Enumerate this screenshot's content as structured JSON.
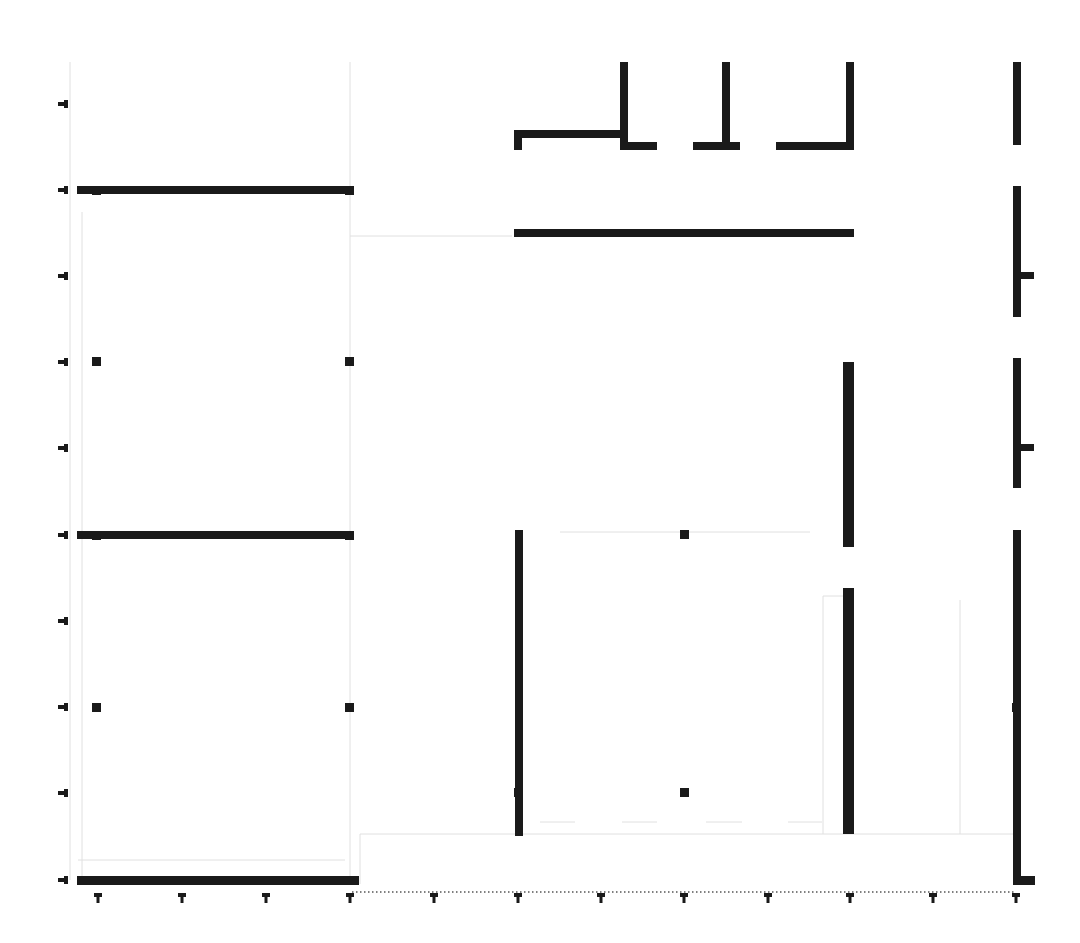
{
  "drawing": {
    "type": "architectural-floor-plan",
    "background": "#ffffff",
    "wall_color": "#1a1a1a",
    "faint_line_color": "#e0e0e0",
    "walls": [
      {
        "id": "w-top-left-h",
        "x": 77,
        "y": 186,
        "w": 277,
        "h": 8
      },
      {
        "id": "w-mid-left-h",
        "x": 77,
        "y": 531,
        "w": 277,
        "h": 8
      },
      {
        "id": "w-bottom-left-h",
        "x": 77,
        "y": 876,
        "w": 282,
        "h": 9
      },
      {
        "id": "w-top-hook-h",
        "x": 514,
        "y": 130,
        "w": 110,
        "h": 8
      },
      {
        "id": "w-top-hook-v",
        "x": 514,
        "y": 130,
        "w": 8,
        "h": 20
      },
      {
        "id": "w-top-col1-v",
        "x": 620,
        "y": 62,
        "w": 8,
        "h": 88
      },
      {
        "id": "w-top-col1-foot",
        "x": 620,
        "y": 142,
        "w": 37,
        "h": 8
      },
      {
        "id": "w-top-col2-v",
        "x": 722,
        "y": 62,
        "w": 8,
        "h": 88
      },
      {
        "id": "w-top-col2-foot",
        "x": 693,
        "y": 142,
        "w": 47,
        "h": 8
      },
      {
        "id": "w-top-col3-v",
        "x": 846,
        "y": 62,
        "w": 8,
        "h": 88
      },
      {
        "id": "w-top-col3-foot",
        "x": 776,
        "y": 142,
        "w": 78,
        "h": 8
      },
      {
        "id": "w-upper-mid-h",
        "x": 514,
        "y": 229,
        "w": 340,
        "h": 8
      },
      {
        "id": "w-center-left-v",
        "x": 515,
        "y": 530,
        "w": 8,
        "h": 306
      },
      {
        "id": "w-center-right-v-upper",
        "x": 843,
        "y": 362,
        "w": 11,
        "h": 185
      },
      {
        "id": "w-center-right-v-lower",
        "x": 843,
        "y": 588,
        "w": 11,
        "h": 246
      },
      {
        "id": "w-right-v-1",
        "x": 1013,
        "y": 62,
        "w": 8,
        "h": 83
      },
      {
        "id": "w-right-v-2",
        "x": 1013,
        "y": 186,
        "w": 8,
        "h": 131
      },
      {
        "id": "w-right-v-2-stub",
        "x": 1021,
        "y": 272,
        "w": 13,
        "h": 7
      },
      {
        "id": "w-right-v-3",
        "x": 1013,
        "y": 358,
        "w": 8,
        "h": 130
      },
      {
        "id": "w-right-v-3-stub",
        "x": 1021,
        "y": 444,
        "w": 13,
        "h": 7
      },
      {
        "id": "w-right-v-4",
        "x": 1013,
        "y": 530,
        "w": 8,
        "h": 354
      },
      {
        "id": "w-right-bottom-foot",
        "x": 1013,
        "y": 876,
        "w": 22,
        "h": 9
      }
    ],
    "columns": [
      {
        "id": "col-a1",
        "x": 92,
        "y": 186,
        "s": 9
      },
      {
        "id": "col-a2",
        "x": 345,
        "y": 186,
        "s": 9
      },
      {
        "id": "col-b1",
        "x": 92,
        "y": 357,
        "s": 9
      },
      {
        "id": "col-b2",
        "x": 345,
        "y": 357,
        "s": 9
      },
      {
        "id": "col-c1",
        "x": 92,
        "y": 531,
        "s": 9
      },
      {
        "id": "col-c2",
        "x": 345,
        "y": 531,
        "s": 9
      },
      {
        "id": "col-d1",
        "x": 92,
        "y": 703,
        "s": 9
      },
      {
        "id": "col-d2",
        "x": 345,
        "y": 703,
        "s": 9
      },
      {
        "id": "col-e1",
        "x": 680,
        "y": 530,
        "s": 9
      },
      {
        "id": "col-e2",
        "x": 680,
        "y": 788,
        "s": 9
      },
      {
        "id": "col-f1",
        "x": 514,
        "y": 788,
        "s": 9
      },
      {
        "id": "col-f2",
        "x": 1012,
        "y": 703,
        "s": 9
      }
    ],
    "left_grid_markers_y": [
      104,
      190,
      276,
      362,
      448,
      535,
      621,
      707,
      793,
      880
    ],
    "left_grid_marker_x": 60,
    "bottom_grid_markers_x": [
      98,
      182,
      266,
      350,
      434,
      518,
      601,
      684,
      768,
      850,
      933,
      1016
    ],
    "bottom_grid_marker_y": 896,
    "bottom_dotted_line": {
      "x1": 352,
      "x2": 1016,
      "y": 892
    },
    "faint_lines": [
      {
        "x1": 70,
        "y1": 62,
        "x2": 70,
        "y2": 880
      },
      {
        "x1": 350,
        "y1": 62,
        "x2": 350,
        "y2": 880
      },
      {
        "x1": 82,
        "y1": 212,
        "x2": 82,
        "y2": 880
      },
      {
        "x1": 360,
        "y1": 834,
        "x2": 1015,
        "y2": 834
      },
      {
        "x1": 360,
        "y1": 834,
        "x2": 360,
        "y2": 884
      },
      {
        "x1": 560,
        "y1": 532,
        "x2": 810,
        "y2": 532
      },
      {
        "x1": 540,
        "y1": 822,
        "x2": 575,
        "y2": 822
      },
      {
        "x1": 622,
        "y1": 822,
        "x2": 657,
        "y2": 822
      },
      {
        "x1": 706,
        "y1": 822,
        "x2": 742,
        "y2": 822
      },
      {
        "x1": 788,
        "y1": 822,
        "x2": 822,
        "y2": 822
      },
      {
        "x1": 823,
        "y1": 596,
        "x2": 823,
        "y2": 834
      },
      {
        "x1": 823,
        "y1": 596,
        "x2": 843,
        "y2": 596
      },
      {
        "x1": 350,
        "y1": 236,
        "x2": 512,
        "y2": 236
      },
      {
        "x1": 960,
        "y1": 600,
        "x2": 960,
        "y2": 834
      },
      {
        "x1": 78,
        "y1": 860,
        "x2": 345,
        "y2": 860
      }
    ]
  }
}
